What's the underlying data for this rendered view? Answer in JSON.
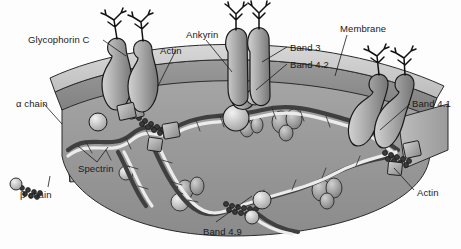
{
  "figure": {
    "type": "biological-diagram",
    "background_color": "#ffffff",
    "palette": {
      "membrane_outer": "#c9c9c9",
      "membrane_core": "#8f8f8f",
      "cytoplasm": "#9a9a9a",
      "protein_fill": "#b0b0b0",
      "protein_dark": "#6e6e6e",
      "spectrin_alpha": "#4a4a4a",
      "spectrin_beta": "#e8e8e8",
      "outline": "#1a1a1a",
      "label_text": "#1a1a1a"
    }
  },
  "labels": [
    {
      "id": "glycophorin-c",
      "text": "Glycophorin C",
      "x": 28,
      "y": 35
    },
    {
      "id": "actin-top",
      "text": "Actin",
      "x": 160,
      "y": 46
    },
    {
      "id": "ankyrin",
      "text": "Ankyrin",
      "x": 186,
      "y": 30
    },
    {
      "id": "band-3",
      "text": "Band 3",
      "x": 290,
      "y": 43
    },
    {
      "id": "band-4-2",
      "text": "Band 4.2",
      "x": 290,
      "y": 60
    },
    {
      "id": "membrane",
      "text": "Membrane",
      "x": 340,
      "y": 24
    },
    {
      "id": "band-4-1",
      "text": "Band 4.1",
      "x": 412,
      "y": 99
    },
    {
      "id": "alpha-chain",
      "text": "α chain",
      "x": 16,
      "y": 99
    },
    {
      "id": "spectrin",
      "text": "Spectrin",
      "x": 78,
      "y": 164
    },
    {
      "id": "beta-chain",
      "text": "β chain",
      "x": 20,
      "y": 190
    },
    {
      "id": "band-4-9",
      "text": "Band 4.9",
      "x": 203,
      "y": 227
    },
    {
      "id": "actin-right",
      "text": "Actin",
      "x": 417,
      "y": 188
    }
  ],
  "structures": {
    "membrane_bilayer": "curved arc band across upper portion",
    "cytoplasmic_face": "darker grey region beneath membrane",
    "glycophorin_groups": 3,
    "band3_dimers": 1,
    "junctional_complexes": 3,
    "hemoglobin_blobs": 5
  }
}
